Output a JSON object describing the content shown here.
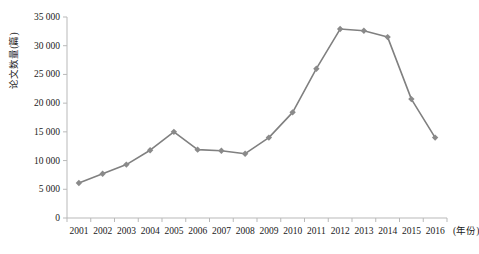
{
  "chart_data": {
    "type": "line",
    "title": "",
    "xlabel": "(年份)",
    "ylabel": "论文数量(篇)",
    "categories": [
      "2001",
      "2002",
      "2003",
      "2004",
      "2005",
      "2006",
      "2007",
      "2008",
      "2009",
      "2010",
      "2011",
      "2012",
      "2013",
      "2014",
      "2015",
      "2016"
    ],
    "values": [
      6100,
      7700,
      9300,
      11800,
      15000,
      11900,
      11700,
      11200,
      14000,
      18400,
      26000,
      32900,
      32600,
      31500,
      20700,
      14000
    ],
    "series": [
      {
        "name": "论文数量",
        "values": [
          6100,
          7700,
          9300,
          11800,
          15000,
          11900,
          11700,
          11200,
          14000,
          18400,
          26000,
          32900,
          32600,
          31500,
          20700,
          14000
        ]
      }
    ],
    "ylim": [
      0,
      35000
    ],
    "ytick_values": [
      0,
      5000,
      10000,
      15000,
      20000,
      25000,
      30000,
      35000
    ],
    "ytick_labels": [
      "0",
      "5 000",
      "10 000",
      "15 000",
      "20 000",
      "25 000",
      "30 000",
      "35 000"
    ],
    "grid": false,
    "legend": "none",
    "marker": "diamond",
    "line_color": "#808080",
    "marker_color": "#8a8a8a",
    "axis_color": "#b9b9b9",
    "text_color": "#1a1a1a"
  }
}
